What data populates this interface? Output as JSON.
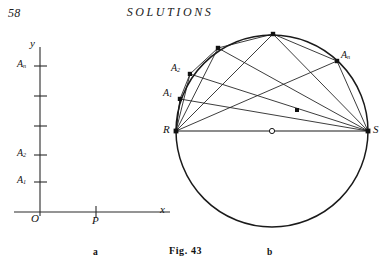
{
  "page": {
    "folio": "58",
    "running_head": "SOLUTIONS",
    "background_color": "#ffffff",
    "ink_color": "#1a1a1a"
  },
  "figure": {
    "caption": "Fig. 43",
    "panel_labels": {
      "left": "a",
      "right": "b"
    }
  },
  "panel_a": {
    "name": "coordinate-axes-panel",
    "axis_labels": {
      "y": "y",
      "x": "x",
      "origin": "O"
    },
    "point_label": "P",
    "tick_labels": [
      {
        "label": "A",
        "sub": "n",
        "y": 66
      },
      {
        "label": "",
        "sub": "",
        "y": 96
      },
      {
        "label": "",
        "sub": "",
        "y": 126
      },
      {
        "label": "A",
        "sub": "2",
        "y": 155
      },
      {
        "label": "A",
        "sub": "1",
        "y": 182
      }
    ],
    "axis_geometry": {
      "y_axis_x": 40,
      "y_axis_top": 48,
      "y_axis_bottom": 216,
      "x_axis_y": 212,
      "x_axis_left": 14,
      "x_axis_right": 170,
      "origin_x": 40,
      "point_p_x": 96
    }
  },
  "panel_b": {
    "name": "circle-chord-panel",
    "circle": {
      "cx": 272,
      "cy": 131,
      "r": 96
    },
    "center_marker": "open-dot",
    "diameter_endpoints": {
      "left": "R",
      "right": "S"
    },
    "labels": {
      "R": "R",
      "S": "S",
      "A1": {
        "label": "A",
        "sub": "1"
      },
      "A2": {
        "label": "A",
        "sub": "2"
      },
      "An": {
        "label": "A",
        "sub": "n"
      }
    },
    "vertices": [
      {
        "id": "R",
        "x": 176,
        "y": 131,
        "marker": "solid"
      },
      {
        "id": "A1",
        "x": 180,
        "y": 99,
        "marker": "solid"
      },
      {
        "id": "A2",
        "x": 190,
        "y": 74,
        "marker": "solid"
      },
      {
        "id": "A3",
        "x": 218,
        "y": 48,
        "marker": "solid"
      },
      {
        "id": "A4",
        "x": 273,
        "y": 34,
        "marker": "solid"
      },
      {
        "id": "An",
        "x": 337,
        "y": 61,
        "marker": "solid"
      },
      {
        "id": "S",
        "x": 368,
        "y": 131,
        "marker": "solid"
      },
      {
        "id": "C",
        "x": 272,
        "y": 131,
        "marker": "open"
      },
      {
        "id": "M",
        "x": 297,
        "y": 110,
        "marker": "solid"
      }
    ],
    "chords": [
      [
        "R",
        "S"
      ],
      [
        "R",
        "A1"
      ],
      [
        "R",
        "A2"
      ],
      [
        "R",
        "A3"
      ],
      [
        "R",
        "A4"
      ],
      [
        "R",
        "An"
      ],
      [
        "S",
        "A1"
      ],
      [
        "S",
        "A2"
      ],
      [
        "S",
        "A3"
      ],
      [
        "S",
        "A4"
      ],
      [
        "S",
        "An"
      ],
      [
        "A1",
        "A2"
      ],
      [
        "A2",
        "A3"
      ],
      [
        "A3",
        "A4"
      ],
      [
        "A4",
        "An"
      ]
    ]
  }
}
